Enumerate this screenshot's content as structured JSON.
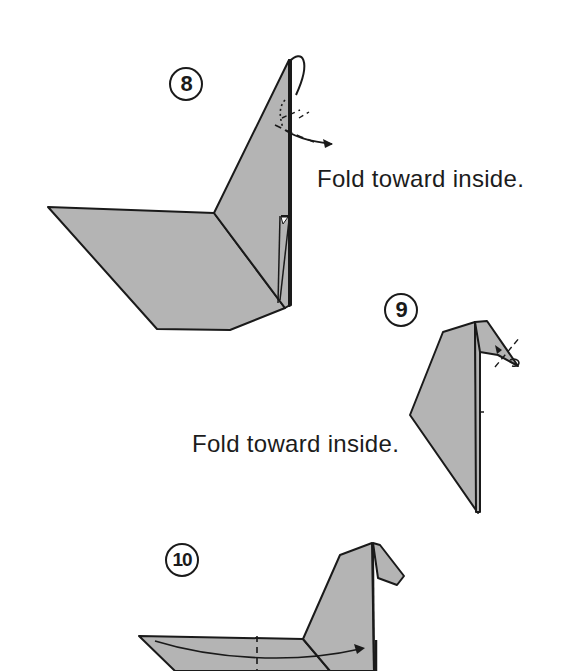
{
  "colors": {
    "paper": "#b4b4b4",
    "line": "#1a1a1a",
    "background": "#ffffff"
  },
  "steps": [
    {
      "number": "8",
      "caption": "Fold toward inside."
    },
    {
      "number": "9",
      "caption": "Fold toward inside."
    },
    {
      "number": "10",
      "caption": ""
    }
  ]
}
